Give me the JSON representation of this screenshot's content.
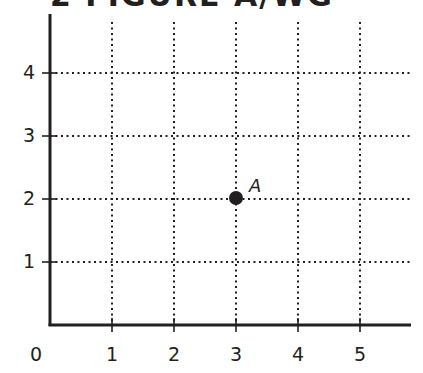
{
  "header": {
    "title": "2 FIGURE A/WG"
  },
  "chart_data": {
    "type": "scatter",
    "title": "",
    "xlabel": "",
    "ylabel": "",
    "x_ticks": [
      "0",
      "1",
      "2",
      "3",
      "4",
      "5"
    ],
    "y_ticks": [
      "1",
      "2",
      "3",
      "4"
    ],
    "xlim": [
      0,
      5.8
    ],
    "ylim": [
      0,
      4.8
    ],
    "grid": "dotted",
    "points": [
      {
        "label": "A",
        "x": 3,
        "y": 2
      }
    ],
    "colors": {
      "ink": "#231f20",
      "background": "#ffffff"
    }
  }
}
